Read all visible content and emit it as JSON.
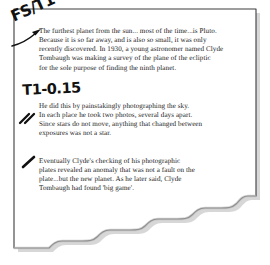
{
  "document": {
    "type": "scanned-slide-page",
    "title_visible": false,
    "page_background": "#ffffff",
    "border_color": "#3c3c3c",
    "ink_color": "#111111",
    "body_text_color": "#1b1b1b",
    "shadow_color": "#c9c9c9"
  },
  "body": {
    "paragraphs": [
      {
        "id": "paragraph-pluto-discovery",
        "text": "The furthest planet from the sun... most of the time...is Pluto.\nBecause it is so far away, and is also so small, it was only\nrecently discovered. In 1930, a young astronomer named Clyde\nTombaugh was making a survey of the plane of the ecliptic\nfor the sole purpose of finding the ninth planet."
      },
      {
        "id": "paragraph-photographic-method",
        "text": "He did this by painstakingly photographing the sky.\nIn each place he took two photos, several days apart.\nSince stars do not move, anything that changed between\nexposures was not a star."
      },
      {
        "id": "paragraph-big-game",
        "text": "Eventually Clyde's checking of his photographic\nplates revealed an anomaly that was not a fault on the\nplate...but the new planet. As he later said, Clyde\nTombaugh had found 'big game'."
      }
    ]
  },
  "annotations": {
    "top_code": "FS/T1",
    "mid_code": "T1-0.15",
    "margin_marks": [
      {
        "id": "double-slash-mark",
        "glyph": "//"
      },
      {
        "id": "single-slash-mark",
        "glyph": "/"
      }
    ],
    "pointer_label": "curved-arrow-to-first-line"
  },
  "icons": {
    "arrow": "curved-arrow-icon",
    "slash_double": "double-slash-pen-mark-icon",
    "slash_single": "single-slash-pen-mark-icon",
    "torn_edge": "torn-paper-edge-icon"
  }
}
